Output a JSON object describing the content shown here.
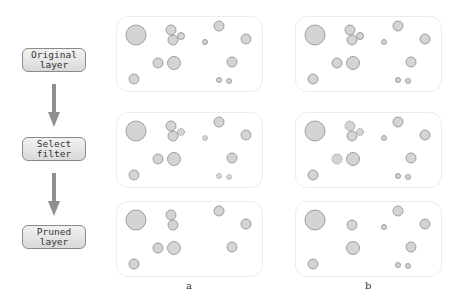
{
  "steps": [
    {
      "label": "Original\nlayer"
    },
    {
      "label": "Select\nfilter"
    },
    {
      "label": "Pruned\nlayer"
    }
  ],
  "columns": [
    {
      "label": "a"
    },
    {
      "label": "b"
    }
  ],
  "colors": {
    "circle_fill": "#d4d4d4",
    "circle_stroke": "#8c8c8c",
    "arrow": "#8f8f8f",
    "panel_border": "#ececec"
  },
  "filters": [
    {
      "id": 1,
      "x": 136,
      "y": 35,
      "r": 10
    },
    {
      "id": 2,
      "x": 171,
      "y": 30,
      "r": 5
    },
    {
      "id": 3,
      "x": 173,
      "y": 40,
      "r": 5
    },
    {
      "id": 4,
      "x": 181,
      "y": 36,
      "r": 3.5
    },
    {
      "id": 5,
      "x": 205,
      "y": 42,
      "r": 2.5
    },
    {
      "id": 6,
      "x": 219,
      "y": 26,
      "r": 5
    },
    {
      "id": 7,
      "x": 246,
      "y": 39,
      "r": 5
    },
    {
      "id": 8,
      "x": 158,
      "y": 63,
      "r": 5
    },
    {
      "id": 9,
      "x": 174,
      "y": 63,
      "r": 6.5
    },
    {
      "id": 10,
      "x": 232,
      "y": 62,
      "r": 5
    },
    {
      "id": 11,
      "x": 134,
      "y": 79,
      "r": 5
    },
    {
      "id": 12,
      "x": 219,
      "y": 80,
      "r": 2.5
    },
    {
      "id": 13,
      "x": 229,
      "y": 81,
      "r": 2.5
    }
  ],
  "selected": {
    "a": [
      4,
      5,
      12,
      13
    ],
    "b": [
      2,
      4,
      8
    ]
  }
}
